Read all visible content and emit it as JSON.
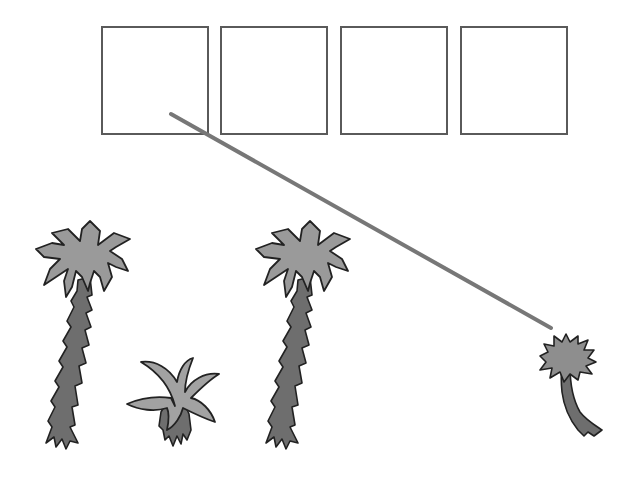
{
  "game": {
    "type": "size-ordering drag-and-drop",
    "slots": [
      {
        "index": 1,
        "filled": false
      },
      {
        "index": 2,
        "filled": false
      },
      {
        "index": 3,
        "filled": false
      },
      {
        "index": 4,
        "filled": false
      }
    ],
    "pieces": [
      {
        "name": "tall palm tree",
        "icon": "palm-tree-tall-icon"
      },
      {
        "name": "small plant",
        "icon": "small-plant-icon"
      },
      {
        "name": "tall palm tree",
        "icon": "palm-tree-tall-icon"
      },
      {
        "name": "short palm tree",
        "icon": "palm-tree-short-icon"
      }
    ],
    "drag_line": {
      "from": [
        171,
        114
      ],
      "to": [
        551,
        328
      ],
      "color": "#777777"
    }
  },
  "colors": {
    "slot_border": "#5a5a5a",
    "foliage": "#9a9a9a",
    "trunk": "#6e6e6e",
    "outline": "#222222",
    "background": "#ffffff"
  }
}
